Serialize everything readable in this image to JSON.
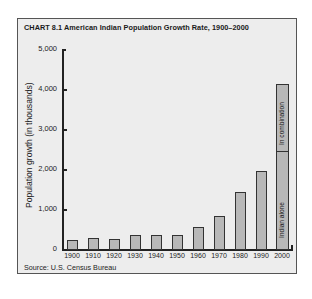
{
  "chart_data": {
    "type": "bar",
    "title": "CHART 8.1  American Indian Population Growth Rate, 1900–2000",
    "xlabel": "",
    "ylabel": "Population growth (in thousands)",
    "ylim": [
      0,
      5000
    ],
    "yticks": [
      "0",
      "1,000",
      "2,000",
      "3,000",
      "4,000",
      "5,000"
    ],
    "grid": false,
    "categories": [
      "1900",
      "1910",
      "1920",
      "1930",
      "1940",
      "1950",
      "1960",
      "1970",
      "1980",
      "1990",
      "2000"
    ],
    "values": [
      237,
      276,
      244,
      343,
      345,
      357,
      552,
      827,
      1420,
      1959,
      4119
    ],
    "stacked_2000": {
      "segments": [
        {
          "name": "Indian alone",
          "value": 2476
        },
        {
          "name": "In combination",
          "value": 1643
        }
      ]
    },
    "source": "Source:  U.S. Census Bureau"
  },
  "labels": {
    "title": "CHART 8.1  American Indian Population Growth Rate, 1900–2000",
    "ylabel": "Population growth (in thousands)",
    "seg_alone": "Indian alone",
    "seg_combo": "In combination",
    "source": "Source:  U.S. Census Bureau"
  }
}
